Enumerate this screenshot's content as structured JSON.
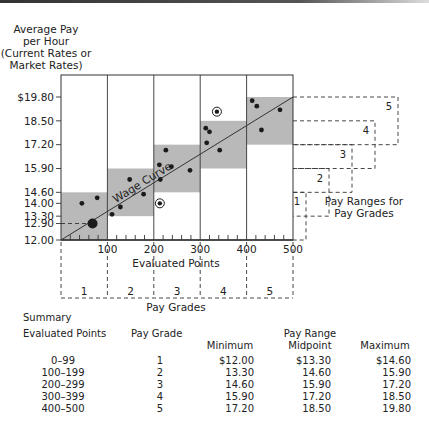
{
  "chart_data": {
    "type": "scatter",
    "title": "",
    "ylabel": "Average Pay per Hour (Current Rates or Market Rates)",
    "ylabel_lines": [
      "Average Pay",
      "per Hour",
      "(Current Rates or",
      "Market Rates)"
    ],
    "xlabel": "Evaluated Points",
    "secondary_xlabel": "Pay Grades",
    "xlim": [
      0,
      500
    ],
    "ylim": [
      12.0,
      19.8
    ],
    "x_ticks": [
      "100",
      "200",
      "300",
      "400",
      "500"
    ],
    "y_ticks": [
      "$19.80",
      "18.50",
      "17.20",
      "15.90",
      "14.60",
      "14.00",
      "13.30",
      "12.90",
      "12.00"
    ],
    "curve_label": "Wage Curve",
    "wage_curve": {
      "x": [
        0,
        500
      ],
      "y": [
        12.0,
        19.8
      ]
    },
    "pay_ranges": [
      {
        "grade": 1,
        "x_min": 0,
        "x_max": 100,
        "min": 12.0,
        "max": 14.6
      },
      {
        "grade": 2,
        "x_min": 100,
        "x_max": 200,
        "min": 13.3,
        "max": 15.9
      },
      {
        "grade": 3,
        "x_min": 200,
        "x_max": 300,
        "min": 14.6,
        "max": 17.2
      },
      {
        "grade": 4,
        "x_min": 300,
        "x_max": 400,
        "min": 15.9,
        "max": 18.5
      },
      {
        "grade": 5,
        "x_min": 400,
        "x_max": 500,
        "min": 17.2,
        "max": 19.8
      }
    ],
    "points": [
      {
        "x": 45,
        "y": 14.0
      },
      {
        "x": 78,
        "y": 14.3
      },
      {
        "x": 68,
        "y": 12.9,
        "highlight": "large"
      },
      {
        "x": 110,
        "y": 13.4
      },
      {
        "x": 128,
        "y": 13.8
      },
      {
        "x": 148,
        "y": 15.3
      },
      {
        "x": 178,
        "y": 14.5
      },
      {
        "x": 212,
        "y": 16.1
      },
      {
        "x": 214,
        "y": 15.3
      },
      {
        "x": 226,
        "y": 16.9
      },
      {
        "x": 238,
        "y": 16.0
      },
      {
        "x": 278,
        "y": 15.8
      },
      {
        "x": 213,
        "y": 14.0,
        "highlight": "circled"
      },
      {
        "x": 312,
        "y": 18.1
      },
      {
        "x": 320,
        "y": 17.9
      },
      {
        "x": 314,
        "y": 17.3
      },
      {
        "x": 336,
        "y": 19.0,
        "highlight": "circled"
      },
      {
        "x": 342,
        "y": 16.9
      },
      {
        "x": 412,
        "y": 19.6
      },
      {
        "x": 422,
        "y": 19.3
      },
      {
        "x": 432,
        "y": 18.0
      },
      {
        "x": 472,
        "y": 19.1
      }
    ],
    "side_annotation": "Pay Ranges for Pay Grades",
    "side_annotation_lines": [
      "Pay Ranges for",
      "Pay Grades"
    ],
    "grade_labels": [
      "1",
      "2",
      "3",
      "4",
      "5"
    ],
    "dashed_line_label": "12.90"
  },
  "summary": {
    "title": "Summary",
    "headers": {
      "points": "Evaluated Points",
      "grade": "Pay Grade",
      "range_group": "Pay Range",
      "min": "Minimum",
      "mid": "Midpoint",
      "max": "Maximum"
    },
    "rows": [
      {
        "points": "0–99",
        "grade": "1",
        "min": "$12.00",
        "mid": "$13.30",
        "max": "$14.60"
      },
      {
        "points": "100–199",
        "grade": "2",
        "min": "13.30",
        "mid": "14.60",
        "max": "15.90"
      },
      {
        "points": "200–299",
        "grade": "3",
        "min": "14.60",
        "mid": "15.90",
        "max": "17.20"
      },
      {
        "points": "300–399",
        "grade": "4",
        "min": "15.90",
        "mid": "17.20",
        "max": "18.50"
      },
      {
        "points": "400–500",
        "grade": "5",
        "min": "17.20",
        "mid": "18.50",
        "max": "19.80"
      }
    ]
  },
  "colors": {
    "band": "#b9b9b9",
    "line": "#333333",
    "dot": "#1a1a1a",
    "text": "#222222"
  }
}
